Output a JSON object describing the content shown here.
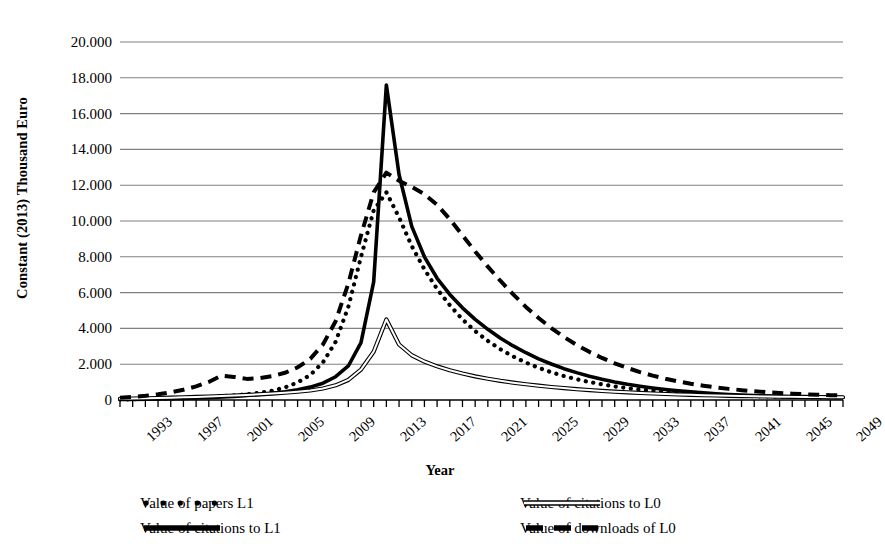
{
  "chart_data": {
    "type": "line",
    "title": "",
    "xlabel": "Year",
    "ylabel": "Constant (2013) Thousand Euro",
    "xlim": [
      1993,
      2050
    ],
    "ylim": [
      0,
      20000
    ],
    "ytick_labels": [
      "20.000",
      "18.000",
      "16.000",
      "14.000",
      "12.000",
      "10.000",
      "8.000",
      "6.000",
      "4.000",
      "2.000",
      "0"
    ],
    "ytick_values": [
      20000,
      18000,
      16000,
      14000,
      12000,
      10000,
      8000,
      6000,
      4000,
      2000,
      0
    ],
    "xtick_labels": [
      "1993",
      "1997",
      "2001",
      "2005",
      "2009",
      "2013",
      "2017",
      "2021",
      "2025",
      "2029",
      "2033",
      "2037",
      "2041",
      "2045",
      "2049"
    ],
    "xtick_values": [
      1993,
      1997,
      2001,
      2005,
      2009,
      2013,
      2017,
      2021,
      2025,
      2029,
      2033,
      2037,
      2041,
      2045,
      2049
    ],
    "minor_tick_step": 1,
    "grid": "horizontal",
    "legend_position": "bottom",
    "x": [
      1993,
      1994,
      1995,
      1996,
      1997,
      1998,
      1999,
      2000,
      2001,
      2002,
      2003,
      2004,
      2005,
      2006,
      2007,
      2008,
      2009,
      2010,
      2011,
      2012,
      2013,
      2014,
      2015,
      2016,
      2017,
      2018,
      2019,
      2020,
      2021,
      2022,
      2023,
      2024,
      2025,
      2026,
      2027,
      2028,
      2029,
      2030,
      2031,
      2032,
      2033,
      2034,
      2035,
      2036,
      2037,
      2038,
      2039,
      2040,
      2041,
      2042,
      2043,
      2044,
      2045,
      2046,
      2047,
      2048,
      2049,
      2050
    ],
    "series": [
      {
        "name": "Value of papers L1",
        "style": "dotted",
        "width": 3.4,
        "color": "#000000",
        "values": [
          30,
          40,
          55,
          70,
          90,
          110,
          140,
          175,
          215,
          260,
          320,
          400,
          520,
          700,
          980,
          1400,
          2100,
          3250,
          5200,
          8000,
          10600,
          11600,
          10200,
          8600,
          7300,
          6200,
          5300,
          4500,
          3850,
          3300,
          2830,
          2430,
          2090,
          1800,
          1550,
          1340,
          1160,
          1005,
          875,
          760,
          665,
          580,
          510,
          450,
          400,
          355,
          318,
          285,
          258,
          235,
          215,
          198,
          184,
          172,
          162,
          153,
          146,
          140
        ]
      },
      {
        "name": "Value of citations to L1",
        "style": "solid-thick",
        "width": 3.6,
        "color": "#000000",
        "values": [
          25,
          32,
          42,
          54,
          68,
          85,
          108,
          135,
          168,
          205,
          250,
          305,
          375,
          460,
          570,
          720,
          940,
          1300,
          1900,
          3200,
          6600,
          17600,
          12600,
          9700,
          8000,
          6800,
          5900,
          5150,
          4500,
          3950,
          3450,
          3020,
          2640,
          2300,
          2010,
          1750,
          1530,
          1330,
          1160,
          1010,
          880,
          770,
          672,
          588,
          516,
          452,
          398,
          350,
          310,
          275,
          245,
          220,
          198,
          180,
          165,
          152,
          142,
          134
        ]
      },
      {
        "name": "Value of citations to L0",
        "style": "double-thin",
        "width": 1.2,
        "color": "#000000",
        "values": [
          70,
          80,
          95,
          110,
          130,
          150,
          172,
          196,
          222,
          250,
          282,
          318,
          358,
          405,
          460,
          530,
          640,
          820,
          1120,
          1700,
          2700,
          4500,
          3100,
          2500,
          2150,
          1880,
          1660,
          1480,
          1320,
          1190,
          1070,
          970,
          880,
          800,
          728,
          664,
          606,
          554,
          508,
          466,
          428,
          394,
          364,
          336,
          312,
          290,
          270,
          252,
          236,
          222,
          209,
          198,
          188,
          179,
          171,
          164,
          158,
          153
        ]
      },
      {
        "name": "Value of downloads of L0",
        "style": "dashed",
        "width": 4.0,
        "color": "#000000",
        "values": [
          120,
          170,
          235,
          320,
          430,
          570,
          760,
          1010,
          1360,
          1290,
          1180,
          1220,
          1330,
          1520,
          1820,
          2300,
          3100,
          4400,
          6500,
          9200,
          11600,
          12700,
          12250,
          11900,
          11500,
          10900,
          10100,
          9200,
          8300,
          7450,
          6650,
          5900,
          5200,
          4580,
          4020,
          3520,
          3080,
          2690,
          2350,
          2050,
          1790,
          1560,
          1360,
          1190,
          1040,
          910,
          800,
          705,
          622,
          550,
          488,
          435,
          390,
          352,
          320,
          293,
          270,
          250
        ]
      }
    ]
  },
  "legend": {
    "items": [
      {
        "label": "Value of papers L1",
        "symbol": "dotted-line-swatch"
      },
      {
        "label": "Value of citations to L1",
        "symbol": "solid-thick-line-swatch"
      },
      {
        "label": "Value of citations to L0",
        "symbol": "double-thin-line-swatch"
      },
      {
        "label": "Value of downloads of L0",
        "symbol": "dashed-line-swatch"
      }
    ]
  },
  "colors": {
    "ink": "#000000",
    "gridline": "#808080",
    "background": "#ffffff"
  }
}
